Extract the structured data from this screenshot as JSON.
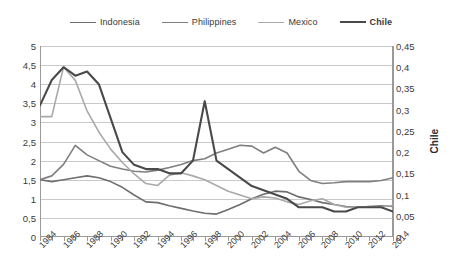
{
  "legend": {
    "position": "top",
    "items": [
      {
        "label": "Indonesia",
        "color": "#6e6e6e",
        "bold": false,
        "width": 1.8
      },
      {
        "label": "Philippines",
        "color": "#7f7f7f",
        "bold": false,
        "width": 1.8
      },
      {
        "label": "Mexico",
        "color": "#a9a9a9",
        "bold": false,
        "width": 1.8
      },
      {
        "label": "Chile",
        "color": "#4a4a4a",
        "bold": true,
        "width": 2.4
      }
    ]
  },
  "axes": {
    "left": {
      "min": 0,
      "max": 5,
      "step": 0.5,
      "ticks": [
        "0",
        "0,5",
        "1",
        "1,5",
        "2",
        "2,5",
        "3",
        "3,5",
        "4",
        "4,5",
        "5"
      ]
    },
    "right": {
      "min": 0,
      "max": 0.45,
      "step": 0.05,
      "title": "Chile",
      "ticks": [
        "0",
        "0,05",
        "0,1",
        "0,15",
        "0,2",
        "0,25",
        "0,3",
        "0,35",
        "0,4",
        "0,45"
      ]
    },
    "x": {
      "min": 1984,
      "max": 2014,
      "labels": [
        "1984",
        "1986",
        "1988",
        "1990",
        "1992",
        "1994",
        "1996",
        "1998",
        "2000",
        "2002",
        "2004",
        "2006",
        "2008",
        "2010",
        "2012",
        "2014"
      ]
    }
  },
  "chart_data": {
    "type": "line",
    "title": "",
    "xlabel": "",
    "ylabel": "",
    "ylim": [
      0,
      5
    ],
    "y2lim": [
      0,
      0.45
    ],
    "y2label": "Chile",
    "grid": true,
    "legend_position": "top",
    "x": [
      1984,
      1985,
      1986,
      1987,
      1988,
      1989,
      1990,
      1991,
      1992,
      1993,
      1994,
      1995,
      1996,
      1997,
      1998,
      1999,
      2000,
      2001,
      2002,
      2003,
      2004,
      2005,
      2006,
      2007,
      2008,
      2009,
      2010,
      2011,
      2012,
      2013,
      2014
    ],
    "series": [
      {
        "name": "Indonesia",
        "axis": "left",
        "color": "#6e6e6e",
        "values": [
          1.5,
          1.45,
          1.5,
          1.55,
          1.6,
          1.55,
          1.45,
          1.3,
          1.1,
          0.92,
          0.9,
          0.82,
          0.75,
          0.68,
          0.62,
          0.6,
          0.72,
          0.85,
          1.0,
          1.12,
          1.2,
          1.18,
          1.05,
          0.98,
          0.9,
          0.85,
          0.8,
          0.78,
          0.8,
          0.82,
          0.8
        ]
      },
      {
        "name": "Philippines",
        "axis": "left",
        "color": "#7f7f7f",
        "values": [
          1.5,
          1.6,
          1.9,
          2.4,
          2.15,
          2.0,
          1.85,
          1.78,
          1.72,
          1.7,
          1.75,
          1.82,
          1.9,
          2.0,
          2.05,
          2.2,
          2.3,
          2.4,
          2.38,
          2.2,
          2.35,
          2.2,
          1.72,
          1.48,
          1.4,
          1.42,
          1.45,
          1.45,
          1.45,
          1.48,
          1.55
        ]
      },
      {
        "name": "Mexico",
        "axis": "left",
        "color": "#a9a9a9",
        "values": [
          3.15,
          3.15,
          4.45,
          4.1,
          3.3,
          2.75,
          2.3,
          1.95,
          1.65,
          1.4,
          1.35,
          1.62,
          1.68,
          1.6,
          1.5,
          1.35,
          1.2,
          1.1,
          1.0,
          1.05,
          1.02,
          0.92,
          0.85,
          0.95,
          1.0,
          0.85,
          0.78,
          0.78,
          0.8,
          0.8,
          0.82
        ]
      },
      {
        "name": "Chile",
        "axis": "right",
        "color": "#4a4a4a",
        "values": [
          0.31,
          0.37,
          0.4,
          0.38,
          0.39,
          0.36,
          0.28,
          0.2,
          0.17,
          0.16,
          0.16,
          0.15,
          0.15,
          0.18,
          0.32,
          0.18,
          0.16,
          0.14,
          0.12,
          0.11,
          0.1,
          0.09,
          0.07,
          0.07,
          0.07,
          0.06,
          0.06,
          0.07,
          0.07,
          0.07,
          0.06
        ]
      }
    ]
  }
}
